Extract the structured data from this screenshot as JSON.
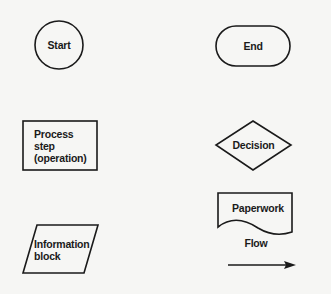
{
  "diagram": {
    "type": "flowchart-symbol-legend",
    "stroke_color": "#1a1a1a",
    "background": "#f6f6f4",
    "symbols": [
      {
        "id": "start",
        "shape": "circle",
        "label": "Start"
      },
      {
        "id": "end",
        "shape": "rounded-stadium",
        "label": "End"
      },
      {
        "id": "process",
        "shape": "rectangle",
        "label_lines": [
          "Process",
          "step",
          "(operation)"
        ]
      },
      {
        "id": "decision",
        "shape": "diamond",
        "label": "Decision"
      },
      {
        "id": "information",
        "shape": "parallelogram",
        "label_lines": [
          "Information",
          "block"
        ]
      },
      {
        "id": "paperwork",
        "shape": "document",
        "label": "Paperwork"
      },
      {
        "id": "flow",
        "shape": "arrow",
        "label": "Flow"
      }
    ]
  }
}
